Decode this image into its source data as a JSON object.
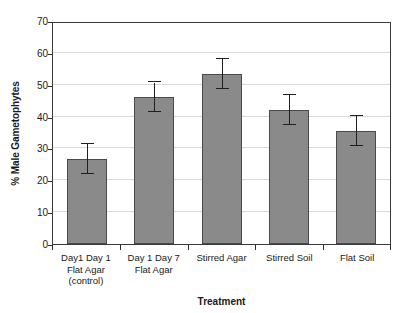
{
  "chart_data": {
    "type": "bar",
    "title": "",
    "subtitle": "",
    "xlabel": "Treatment",
    "ylabel": "% Male Gametophytes",
    "categories": [
      "Day1 Day 1 Flat Agar (control)",
      "Day 1 Day 7 Flat Agar",
      "Stirred Agar",
      "Stirred Soil",
      "Flat Soil"
    ],
    "category_label_lines": [
      [
        "Day1 Day 1",
        "Flat Agar",
        "(control)"
      ],
      [
        "Day 1 Day 7",
        "Flat Agar"
      ],
      [
        "Stirred Agar"
      ],
      [
        "Stirred Soil"
      ],
      [
        "Flat Soil"
      ]
    ],
    "values": [
      26.7,
      46.0,
      53.4,
      42.0,
      35.5
    ],
    "errors": [
      4.7,
      4.7,
      4.7,
      4.7,
      4.7
    ],
    "error_low": [
      22.0,
      41.3,
      48.7,
      37.3,
      30.8
    ],
    "error_high": [
      31.4,
      50.7,
      58.1,
      46.7,
      40.2
    ],
    "ylim": [
      0,
      70
    ],
    "ytick_labels": [
      "0",
      "10",
      "20",
      "30",
      "40",
      "50",
      "60",
      "70"
    ],
    "ytick_values": [
      0,
      10,
      20,
      30,
      40,
      50,
      60,
      70
    ],
    "xlim_categories": 5,
    "grid": "horizontal",
    "legend": "none",
    "bar_color": "#8a8a8a",
    "bar_border_color": "#4a4a4a",
    "gridline_color": "#d9d9d9",
    "axis_color": "#3a3a3a",
    "error_color": "#1f1f1f",
    "background_color": "#ffffff"
  }
}
